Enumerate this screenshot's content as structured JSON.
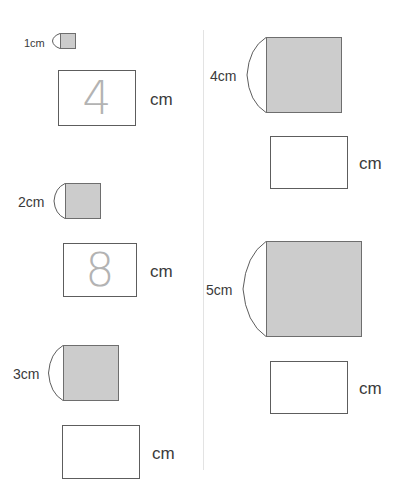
{
  "worksheet": {
    "unit": "cm",
    "divider": {
      "color": "#e3e3e3"
    },
    "colors": {
      "square_fill": "#cccccc",
      "square_stroke": "#6e6e6e",
      "box_stroke": "#5d5d5d",
      "traced_answer": "#b3b3b3",
      "label_text": "#3a3a3a"
    },
    "problems": [
      {
        "id": "problem-1",
        "column": "left",
        "side_label": "1cm",
        "side_value": 1,
        "square_size_px": 16,
        "answer": "4",
        "answer_filled": true,
        "answer_style": "traced",
        "unit": "cm"
      },
      {
        "id": "problem-2",
        "column": "left",
        "side_label": "2cm",
        "side_value": 2,
        "square_size_px": 36,
        "answer": "8",
        "answer_filled": true,
        "answer_style": "traced",
        "unit": "cm"
      },
      {
        "id": "problem-3",
        "column": "left",
        "side_label": "3cm",
        "side_value": 3,
        "square_size_px": 56,
        "answer": "",
        "answer_filled": false,
        "answer_style": "blank",
        "unit": "cm"
      },
      {
        "id": "problem-4",
        "column": "right",
        "side_label": "4cm",
        "side_value": 4,
        "square_size_px": 76,
        "answer": "",
        "answer_filled": false,
        "answer_style": "blank",
        "unit": "cm"
      },
      {
        "id": "problem-5",
        "column": "right",
        "side_label": "5cm",
        "side_value": 5,
        "square_size_px": 96,
        "answer": "",
        "answer_filled": false,
        "answer_style": "blank",
        "unit": "cm"
      }
    ]
  }
}
